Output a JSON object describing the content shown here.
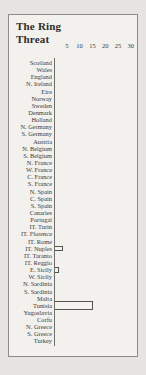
{
  "title": {
    "line1": "The Ring",
    "line2": "Threat"
  },
  "chart_data": {
    "type": "bar",
    "orientation": "horizontal",
    "title": "The Ring Threat",
    "xlabel": "",
    "ylabel": "",
    "xlim": [
      0,
      30
    ],
    "axis_ticks": [
      5,
      10,
      15,
      20,
      25,
      30
    ],
    "grid": false,
    "legend": false,
    "bar_style": "outlined",
    "categories": [
      "Scotland",
      "Wales",
      "England",
      "N. Ireland",
      "Eire",
      "Norway",
      "Sweden",
      "Denmark",
      "Holland",
      "N. Germany",
      "S. Germany",
      "Austria",
      "N. Belgium",
      "S. Belgium",
      "N. France",
      "W. France",
      "C. France",
      "S. France",
      "N. Spain",
      "C. Spain",
      "S. Spain",
      "Canaries",
      "Portugal",
      "IT. Turin",
      "IT. Florence",
      "IT. Rome",
      "IT. Nuples",
      "IT. Taranto",
      "IT. Reggio",
      "E. Sicily",
      "W. Sicily",
      "N. Sardinia",
      "S. Sardinia",
      "Malta",
      "Tunisia",
      "Yugoslavia",
      "Corfu",
      "N. Greece",
      "S. Greece",
      "Turkey"
    ],
    "values": [
      0,
      0,
      0,
      0,
      0,
      0,
      0,
      0,
      0,
      0,
      0,
      0,
      0,
      0,
      0,
      0,
      0,
      0,
      0,
      0,
      0,
      0,
      0,
      0,
      0,
      0,
      3,
      0,
      0,
      1.5,
      0,
      0,
      0,
      0,
      15,
      0,
      0,
      0,
      0,
      0
    ]
  }
}
